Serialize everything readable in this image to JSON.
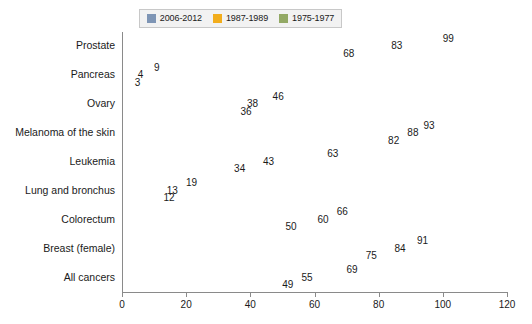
{
  "chart_data": {
    "type": "bar",
    "orientation": "horizontal",
    "title": "",
    "subtitle": "",
    "xlabel": "",
    "ylabel": "",
    "xlim": [
      0,
      120
    ],
    "xticks": [
      "0",
      "20",
      "40",
      "60",
      "80",
      "100",
      "120"
    ],
    "grid": false,
    "legend_position": "top-center",
    "categories": [
      "Prostate",
      "Pancreas",
      "Ovary",
      "Melanoma of the skin",
      "Leukemia",
      "Lung and bronchus",
      "Colorectum",
      "Breast (female)",
      "All cancers"
    ],
    "series": [
      {
        "name": "2006-2012",
        "color": "#7e95b5",
        "values": [
          99,
          9,
          46,
          93,
          63,
          19,
          66,
          91,
          69
        ]
      },
      {
        "name": "1987-1989",
        "color": "#f2ad1c",
        "values": [
          83,
          4,
          38,
          88,
          43,
          13,
          60,
          84,
          55
        ]
      },
      {
        "name": "1975-1977",
        "color": "#93a965",
        "values": [
          68,
          3,
          36,
          82,
          34,
          12,
          50,
          75,
          49
        ]
      }
    ]
  },
  "legend": {
    "items": [
      {
        "label": "2006-2012",
        "color": "#7e95b5"
      },
      {
        "label": "1987-1989",
        "color": "#f2ad1c"
      },
      {
        "label": "1975-1977",
        "color": "#93a965"
      }
    ]
  },
  "axis": {
    "x_ticks": [
      "0",
      "20",
      "40",
      "60",
      "80",
      "100",
      "120"
    ]
  }
}
